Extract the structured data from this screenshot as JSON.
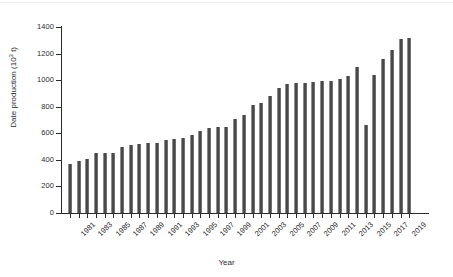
{
  "figure": {
    "background_color": "#ffffff",
    "bar_color": "#4a4a4a",
    "axis_color": "#2b2b2b"
  },
  "chart_data": {
    "type": "bar",
    "title": "",
    "subtitle": "",
    "xlabel": "Year",
    "ylabel": "Date production (10³ t)",
    "ylabel_plain": "Date production (103 t)",
    "ylabel_prefix": "Date production (10",
    "ylabel_exponent": "3",
    "ylabel_suffix": " t)",
    "ylim": [
      0,
      1400
    ],
    "ytick_step": 200,
    "ytick_labels": [
      "0",
      "200",
      "400",
      "600",
      "800",
      "1000",
      "1200",
      "1400"
    ],
    "ytick_values": [
      0,
      200,
      400,
      600,
      800,
      1000,
      1200,
      1400
    ],
    "xtick_label_step": 2,
    "xtick_labels": [
      "1981",
      "1983",
      "1985",
      "1987",
      "1989",
      "1991",
      "1993",
      "1995",
      "1997",
      "1999",
      "2001",
      "2003",
      "2005",
      "2007",
      "2009",
      "2011",
      "2013",
      "2015",
      "2017",
      "2019"
    ],
    "grid": false,
    "legend": false,
    "legend_position": "none",
    "categories": [
      "1981",
      "1982",
      "1983",
      "1984",
      "1985",
      "1986",
      "1987",
      "1988",
      "1989",
      "1990",
      "1991",
      "1992",
      "1993",
      "1994",
      "1995",
      "1996",
      "1997",
      "1998",
      "1999",
      "2000",
      "2001",
      "2002",
      "2003",
      "2004",
      "2005",
      "2006",
      "2007",
      "2008",
      "2009",
      "2010",
      "2011",
      "2012",
      "2013",
      "2014",
      "2015",
      "2016",
      "2017",
      "2018",
      "2019",
      "2020"
    ],
    "values": [
      368,
      395,
      405,
      448,
      448,
      452,
      500,
      512,
      520,
      524,
      528,
      552,
      560,
      568,
      590,
      618,
      638,
      648,
      650,
      710,
      736,
      816,
      828,
      884,
      944,
      972,
      976,
      980,
      988,
      992,
      994,
      1010,
      1034,
      1096,
      660,
      1042,
      1156,
      1230,
      1310,
      1316
    ],
    "series": [
      {
        "name": "Date production",
        "values": [
          368,
          395,
          405,
          448,
          448,
          452,
          500,
          512,
          520,
          524,
          528,
          552,
          560,
          568,
          590,
          618,
          638,
          648,
          650,
          710,
          736,
          816,
          828,
          884,
          944,
          972,
          976,
          980,
          988,
          992,
          994,
          1010,
          1034,
          1096,
          660,
          1042,
          1156,
          1230,
          1310,
          1316
        ]
      }
    ],
    "units": "10^3 tonnes"
  }
}
